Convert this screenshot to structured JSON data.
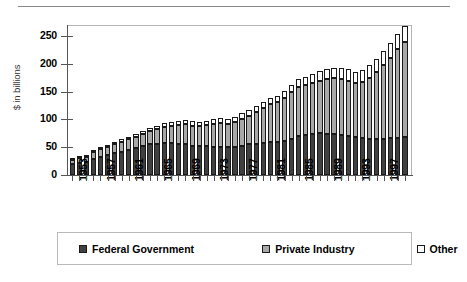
{
  "chart_data": {
    "type": "bar",
    "subtype": "stacked-bar",
    "title": "",
    "xlabel": "",
    "ylabel": "$ in billions",
    "ylim": [
      0,
      270
    ],
    "yticks": [
      0,
      50,
      100,
      150,
      200,
      250
    ],
    "ytick_labels": [
      "0",
      "50",
      "100",
      "150",
      "200",
      "250"
    ],
    "grid": false,
    "legend_position": "bottom",
    "legend": [
      "Federal Government",
      "Private Industry",
      "Other"
    ],
    "colors": {
      "Federal Government": "#404040",
      "Private Industry": "#a8a8a8",
      "Other": "#ffffff",
      "outline": "#1a1a1a",
      "axis": "#555555",
      "frame": "#b5b5b5"
    },
    "categories": [
      1953,
      1954,
      1955,
      1956,
      1957,
      1958,
      1959,
      1960,
      1961,
      1962,
      1963,
      1964,
      1965,
      1966,
      1967,
      1968,
      1969,
      1970,
      1971,
      1972,
      1973,
      1974,
      1975,
      1976,
      1977,
      1978,
      1979,
      1980,
      1981,
      1982,
      1983,
      1984,
      1985,
      1986,
      1987,
      1988,
      1989,
      1990,
      1991,
      1992,
      1993,
      1994,
      1995,
      1996,
      1997,
      1998,
      1999,
      2000
    ],
    "xtick_labels": [
      "1953",
      "1957",
      "1961",
      "1965",
      "1969",
      "1973",
      "1977",
      "1981",
      "1985",
      "1989",
      "1993",
      "1997"
    ],
    "xtick_label_interval": 4,
    "series": [
      {
        "name": "Federal Government",
        "values": [
          19,
          21,
          23,
          28,
          33,
          36,
          40,
          42,
          45,
          48,
          52,
          55,
          56,
          57,
          57,
          56,
          55,
          53,
          52,
          52,
          51,
          50,
          50,
          51,
          53,
          55,
          56,
          58,
          59,
          60,
          62,
          65,
          70,
          72,
          74,
          75,
          74,
          73,
          72,
          70,
          68,
          66,
          64,
          64,
          65,
          66,
          67,
          68
        ]
      },
      {
        "name": "Private Industry",
        "values": [
          8,
          9,
          10,
          13,
          14,
          15,
          16,
          18,
          19,
          20,
          22,
          24,
          27,
          30,
          32,
          34,
          36,
          36,
          36,
          38,
          41,
          43,
          42,
          45,
          48,
          52,
          57,
          62,
          68,
          71,
          76,
          84,
          89,
          90,
          92,
          95,
          99,
          101,
          100,
          99,
          97,
          101,
          111,
          121,
          133,
          145,
          159,
          172
        ]
      },
      {
        "name": "Other",
        "values": [
          2,
          2,
          2,
          3,
          3,
          3,
          4,
          4,
          4,
          5,
          5,
          6,
          6,
          7,
          7,
          7,
          8,
          8,
          8,
          8,
          8,
          9,
          9,
          9,
          10,
          10,
          11,
          11,
          12,
          12,
          13,
          13,
          14,
          15,
          16,
          17,
          18,
          19,
          20,
          21,
          21,
          22,
          23,
          24,
          25,
          26,
          27,
          28
        ]
      }
    ],
    "totals": [
      29,
      32,
      35,
      44,
      50,
      54,
      60,
      64,
      68,
      73,
      79,
      85,
      89,
      94,
      96,
      97,
      99,
      97,
      96,
      98,
      100,
      102,
      101,
      105,
      111,
      117,
      124,
      131,
      139,
      143,
      151,
      162,
      173,
      177,
      182,
      187,
      191,
      193,
      192,
      190,
      186,
      189,
      198,
      209,
      223,
      237,
      253,
      268
    ]
  },
  "legend": {
    "items": [
      {
        "label": "Federal Government",
        "swatch": "dark"
      },
      {
        "label": "Private Industry",
        "swatch": "gray"
      },
      {
        "label": "Other",
        "swatch": "white"
      }
    ]
  }
}
